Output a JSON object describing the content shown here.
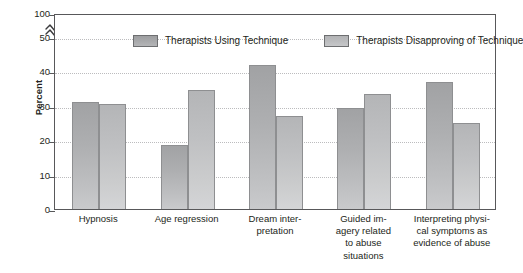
{
  "chart_data": {
    "type": "bar",
    "title": "",
    "subtitle": "",
    "xlabel": "",
    "ylabel": "Percent",
    "ylim": [
      0,
      50
    ],
    "yticks": [
      "0",
      "10",
      "20",
      "30",
      "40",
      "50",
      "100"
    ],
    "ytick_values": [
      0,
      10,
      20,
      30,
      40,
      50,
      100
    ],
    "axis_break": {
      "present": true,
      "between": [
        50,
        100
      ],
      "symbol": "zigzag-break"
    },
    "grid": "horizontal-dotted",
    "legend_position": "top-inside",
    "categories": [
      "Hypnosis",
      "Age regression",
      "Dream interpretation",
      "Guided imagery related to abuse situations",
      "Interpreting physical symptoms as evidence of abuse"
    ],
    "category_label_lines": [
      [
        "Hypnosis"
      ],
      [
        "Age regression"
      ],
      [
        "Dream inter-",
        "pretation"
      ],
      [
        "Guided im-",
        "agery related",
        "to abuse",
        "situations"
      ],
      [
        "Interpreting physi-",
        "cal symptoms as",
        "evidence of abuse"
      ]
    ],
    "series": [
      {
        "name": "Therapists Using Technique",
        "color": "#a9aaac",
        "values": [
          31,
          18.5,
          42,
          29.5,
          37
        ]
      },
      {
        "name": "Therapists Disapproving of Technique",
        "color": "#c0c1c3",
        "values": [
          30.5,
          34.5,
          27,
          33.5,
          25
        ]
      }
    ]
  },
  "legend": {
    "entries": [
      {
        "label": "Therapists Using Technique"
      },
      {
        "label": "Therapists Disapproving of Technique"
      }
    ]
  },
  "colors": {
    "axis": "#58585a",
    "gridline": "#bcbcbe",
    "text": "#231f20",
    "series_0": "#a9aaac",
    "series_1": "#c0c1c3",
    "background": "#ffffff"
  }
}
